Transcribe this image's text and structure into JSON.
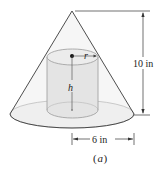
{
  "figure": {
    "caption": "(a)",
    "caption_letter": "a",
    "labels": {
      "radius": "r",
      "height": "h",
      "cone_height": "10 in",
      "cone_radius": "6 in"
    },
    "colors": {
      "outline": "#3a3a3a",
      "cone_fill": "#f3f3f3",
      "cylinder_fill": "#e6e6e6",
      "cylinder_stroke": "#9a9a9a",
      "dimension": "#333333",
      "text": "#222222"
    }
  }
}
